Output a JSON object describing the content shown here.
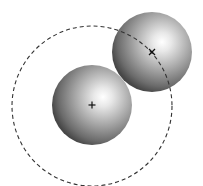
{
  "diagram": {
    "background": "#ffffff",
    "spheres": [
      {
        "name": "lower-sphere",
        "cx": 92,
        "cy": 105,
        "r": 40,
        "highlight_x": 103,
        "highlight_y": 97,
        "center_mark": "+"
      },
      {
        "name": "upper-sphere",
        "cx": 152,
        "cy": 52,
        "r": 40,
        "highlight_x": 162,
        "highlight_y": 42,
        "center_mark": "x"
      }
    ],
    "dashed_circle": {
      "cx": 92,
      "cy": 106,
      "r": 80,
      "stroke": "#333333"
    },
    "colors": {
      "sphere_light": "#ffffff",
      "sphere_mid": "#a8a8a8",
      "sphere_dark": "#4a4a4a",
      "mark": "#111111"
    }
  }
}
